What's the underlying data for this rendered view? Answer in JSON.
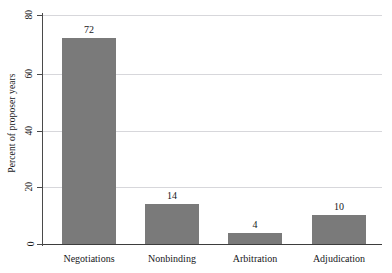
{
  "chart_data": {
    "type": "bar",
    "title": "",
    "subtitle": "",
    "xlabel": "",
    "ylabel": "Percent of proposer years",
    "categories": [
      "Negotiations",
      "Nonbinding",
      "Arbitration",
      "Adjudication"
    ],
    "values": [
      72,
      14,
      4,
      10
    ],
    "value_labels": [
      "72",
      "14",
      "4",
      "10"
    ],
    "ylim": [
      0,
      80
    ],
    "yticks": [
      0,
      20,
      40,
      60,
      80
    ],
    "ytick_labels": [
      "0",
      "20",
      "40",
      "60",
      "80"
    ],
    "grid": "horizontal",
    "legend": "none",
    "series": [
      {
        "name": "Percent of proposer years",
        "values": [
          72,
          14,
          4,
          10
        ]
      }
    ],
    "colors": {
      "bar_fill": "#7a7a7a",
      "gridline": "#d7d7db",
      "axis": "#3d3d3d",
      "text": "#17171a",
      "background": "#ffffff"
    }
  }
}
